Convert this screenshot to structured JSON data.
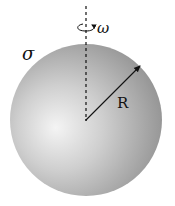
{
  "diagram": {
    "type": "rotating-charged-sphere",
    "labels": {
      "surface_charge": "σ",
      "angular_velocity": "ω",
      "radius": "R"
    },
    "colors": {
      "sphere_light": "#f2f2f2",
      "sphere_mid": "#b8b8b8",
      "sphere_dark": "#8a8a8a",
      "lines": "#111111"
    },
    "elements": {
      "axis": "dashed vertical rotation axis through center",
      "rotation_arrow": "curved arrow around axis",
      "radius_arrow": "arrow from center to surface"
    }
  }
}
